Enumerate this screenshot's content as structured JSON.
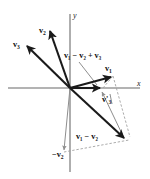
{
  "figure": {
    "background_color": "#ffffff",
    "width": 150,
    "height": 179,
    "origin": {
      "x": 70,
      "y": 88
    }
  },
  "axes": {
    "x_label": "x",
    "y_label": "y",
    "color": "#9a9a9a",
    "x_line": {
      "x1": 8,
      "y1": 88,
      "x2": 140,
      "y2": 88
    },
    "y_line": {
      "x1": 70,
      "y1": 14,
      "x2": 70,
      "y2": 172
    }
  },
  "labels": {
    "v1": {
      "base": "v",
      "sub": "1",
      "prime": "",
      "x": 108,
      "y": 72
    },
    "v2": {
      "base": "v",
      "sub": "2",
      "prime": "",
      "x": 42,
      "y": 33
    },
    "v3": {
      "base": "v",
      "sub": "3",
      "prime": "",
      "x": 17,
      "y": 47
    },
    "v3_prime": {
      "base": "v",
      "sub": "3",
      "prime": "'",
      "x": 105,
      "y": 101
    },
    "neg_v2": {
      "text": "−v",
      "sub": "2",
      "x": 55,
      "y": 157
    },
    "v1_minus_v2": {
      "text": "v₁ − v₂",
      "x": 77,
      "y": 138
    },
    "v1_minus_v2_plus_v3": {
      "text": "v₁ − v₂ + v₃",
      "x": 66,
      "y": 57
    }
  },
  "vectors": [
    {
      "name": "v2",
      "label": "v₂",
      "style": "bold-black",
      "from": {
        "x": 70,
        "y": 88
      },
      "to": {
        "x": 49,
        "y": 29
      }
    },
    {
      "name": "v3",
      "label": "v₃",
      "style": "bold-black",
      "from": {
        "x": 70,
        "y": 88
      },
      "to": {
        "x": 25,
        "y": 44
      }
    },
    {
      "name": "v1",
      "label": "v₁",
      "style": "bold-black",
      "from": {
        "x": 70,
        "y": 88
      },
      "to": {
        "x": 113,
        "y": 76
      }
    },
    {
      "name": "v1-minus-v2",
      "label": "v₁ − v₂",
      "style": "bold-black",
      "from": {
        "x": 70,
        "y": 88
      },
      "to": {
        "x": 126,
        "y": 140
      }
    },
    {
      "name": "resultant-v1-minus-v2-plus-v3",
      "label": "v₁ − v₂ + v₃",
      "style": "bold-black",
      "from": {
        "x": 70,
        "y": 88
      },
      "to": {
        "x": 103,
        "y": 88
      }
    },
    {
      "name": "neg-v2",
      "label": "−v₂",
      "style": "thin-gray",
      "from": {
        "x": 70,
        "y": 88
      },
      "to": {
        "x": 64,
        "y": 152
      }
    },
    {
      "name": "v3-prime",
      "label": "v₃'",
      "style": "thin-gray",
      "from": {
        "x": 122,
        "y": 136
      },
      "to": {
        "x": 101,
        "y": 91
      }
    }
  ],
  "construction_lines": [
    {
      "name": "dash-v1-to-corner",
      "from": {
        "x": 113,
        "y": 76
      },
      "to": {
        "x": 130,
        "y": 137
      }
    },
    {
      "name": "dash-negv2-to-corner",
      "from": {
        "x": 64,
        "y": 152
      },
      "to": {
        "x": 128,
        "y": 141
      }
    },
    {
      "name": "dash-resultant-tip",
      "from": {
        "x": 103,
        "y": 88
      },
      "to": {
        "x": 113,
        "y": 76
      }
    }
  ],
  "leader_lines": [
    {
      "name": "leader-resultant-label",
      "from": {
        "x": 79,
        "y": 62
      },
      "to": {
        "x": 97,
        "y": 85
      }
    },
    {
      "name": "leader-v3prime-label",
      "from": {
        "x": 108,
        "y": 95
      },
      "to": {
        "x": 111,
        "y": 106
      }
    }
  ],
  "colors": {
    "stroke_bold": "#1a1a1a",
    "stroke_thin": "#8e8e8e",
    "axis": "#9a9a9a",
    "dash": "#a2a2a2",
    "text": "#111111"
  }
}
